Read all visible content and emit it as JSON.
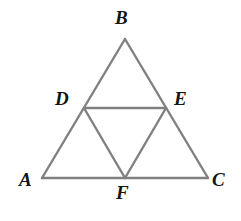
{
  "figure": {
    "type": "geometry-diagram",
    "background_color": "#ffffff",
    "stroke_color": "#808080",
    "stroke_width": 2.4,
    "label_color": "#141414",
    "label_font_size": 19,
    "canvas": {
      "width": 241,
      "height": 221
    },
    "points": [
      {
        "id": "A",
        "label": "A",
        "x": 42,
        "y": 178,
        "role": "vertex"
      },
      {
        "id": "B",
        "label": "B",
        "x": 125,
        "y": 39,
        "role": "apex-vertex"
      },
      {
        "id": "C",
        "label": "C",
        "x": 208,
        "y": 178,
        "role": "vertex"
      },
      {
        "id": "D",
        "label": "D",
        "x": 84,
        "y": 108,
        "role": "midpoint-of-AB"
      },
      {
        "id": "E",
        "label": "E",
        "x": 166,
        "y": 108,
        "role": "midpoint-of-BC"
      },
      {
        "id": "F",
        "label": "F",
        "x": 125,
        "y": 178,
        "role": "midpoint-of-AC"
      }
    ],
    "segments": [
      {
        "id": "AB",
        "from": "A",
        "to": "B",
        "kind": "outer-side"
      },
      {
        "id": "BC",
        "from": "B",
        "to": "C",
        "kind": "outer-side"
      },
      {
        "id": "AC",
        "from": "A",
        "to": "C",
        "kind": "outer-base"
      },
      {
        "id": "DE",
        "from": "D",
        "to": "E",
        "kind": "midsegment"
      },
      {
        "id": "DF",
        "from": "D",
        "to": "F",
        "kind": "midsegment"
      },
      {
        "id": "EF",
        "from": "E",
        "to": "F",
        "kind": "midsegment"
      }
    ]
  }
}
